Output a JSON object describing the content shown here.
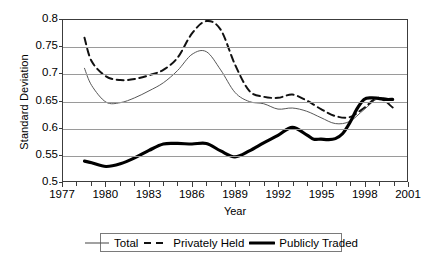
{
  "chart_data": {
    "type": "line",
    "title": "",
    "xlabel": "Year",
    "ylabel": "Standard Deviation",
    "xlim": [
      1977,
      2001
    ],
    "ylim": [
      0.5,
      0.8
    ],
    "grid": "horizontal",
    "legend_position": "bottom",
    "x_tick_labels": [
      "1977",
      "1980",
      "1983",
      "1986",
      "1989",
      "1992",
      "1995",
      "1998",
      "2001"
    ],
    "x_tick_values": [
      1977,
      1980,
      1983,
      1986,
      1989,
      1992,
      1995,
      1998,
      2001
    ],
    "y_tick_labels": [
      "0.8",
      "0.75",
      "0.7",
      "0.65",
      "0.6",
      "0.55",
      "0.5"
    ],
    "y_tick_values": [
      0.8,
      0.75,
      0.7,
      0.65,
      0.6,
      0.55,
      0.5
    ],
    "x": [
      1978.5,
      1979,
      1980,
      1981,
      1982,
      1983,
      1984,
      1985,
      1986,
      1987,
      1988,
      1989,
      1990,
      1991,
      1992,
      1993,
      1994,
      1995,
      1996,
      1997,
      1998,
      1999,
      2000
    ],
    "series": [
      {
        "name": "Total",
        "style": "thin-solid",
        "color": "#555555",
        "values": [
          0.71,
          0.678,
          0.647,
          0.646,
          0.655,
          0.668,
          0.683,
          0.706,
          0.736,
          0.741,
          0.707,
          0.665,
          0.648,
          0.644,
          0.634,
          0.636,
          0.63,
          0.618,
          0.607,
          0.611,
          0.633,
          0.654,
          0.652
        ]
      },
      {
        "name": "Privately Held",
        "style": "dashed",
        "color": "#111111",
        "values": [
          0.767,
          0.723,
          0.695,
          0.688,
          0.69,
          0.697,
          0.707,
          0.73,
          0.775,
          0.798,
          0.782,
          0.717,
          0.668,
          0.657,
          0.655,
          0.661,
          0.65,
          0.634,
          0.621,
          0.619,
          0.636,
          0.655,
          0.637
        ]
      },
      {
        "name": "Publicly Traded",
        "style": "thick-solid",
        "color": "#000000",
        "values": [
          0.537,
          0.534,
          0.527,
          0.532,
          0.543,
          0.557,
          0.569,
          0.57,
          0.569,
          0.57,
          0.556,
          0.545,
          0.556,
          0.571,
          0.585,
          0.6,
          0.586,
          0.57,
          0.557,
          0.55,
          0.565,
          0.59,
          0.591
        ]
      }
    ],
    "series_extra_points": {
      "Publicly Traded": {
        "x": [
          1994.5,
          1995,
          1995.5,
          1996,
          1996.5,
          1997,
          1997.5,
          1998,
          1998.5,
          1999,
          1999.5,
          2000
        ],
        "values": [
          0.578,
          0.578,
          0.577,
          0.579,
          0.588,
          0.608,
          0.634,
          0.652,
          0.655,
          0.654,
          0.652,
          0.652
        ]
      }
    }
  },
  "axis": {
    "y_title": "Standard Deviation",
    "x_title": "Year"
  },
  "legend": {
    "items": [
      {
        "label": "Total",
        "icon": "thin-solid-line-swatch"
      },
      {
        "label": "Privately Held",
        "icon": "dashed-line-swatch"
      },
      {
        "label": "Publicly Traded",
        "icon": "thick-solid-line-swatch"
      }
    ]
  }
}
